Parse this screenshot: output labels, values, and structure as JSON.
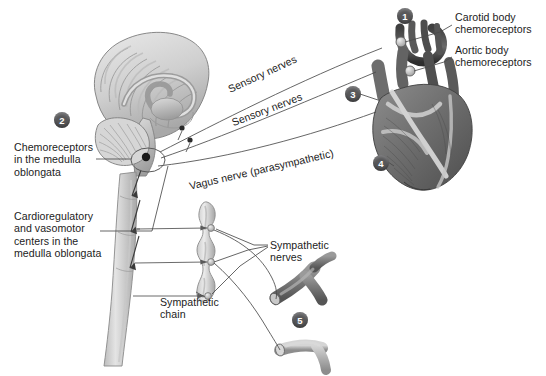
{
  "figure": {
    "background_color": "#ffffff",
    "text_color": "#1c1c1c",
    "marker_fill": "#58585a",
    "marker_text_color": "#ffffff",
    "line_color": "#4a4a4a"
  },
  "labels": {
    "carotid_body": "Carotid body\nchemoreceptors",
    "aortic_body": "Aortic body\nchemoreceptors",
    "medulla_chemoreceptors": "Chemoreceptors\nin the medulla\noblongata",
    "cardioregulatory_centers": "Cardioregulatory\nand vasomotor\ncenters in the\nmedulla oblongata",
    "sensory_nerves_upper": "Sensory nerves",
    "sensory_nerves_lower": "Sensory nerves",
    "vagus_nerve": "Vagus nerve (parasympathetic)",
    "sympathetic_nerves": "Sympathetic\nnerves",
    "sympathetic_chain": "Sympathetic\nchain"
  },
  "markers": [
    {
      "id": "1",
      "label": "1",
      "x": 397,
      "y": 8
    },
    {
      "id": "2",
      "label": "2",
      "x": 54,
      "y": 112
    },
    {
      "id": "3",
      "label": "3",
      "x": 345,
      "y": 86
    },
    {
      "id": "4",
      "label": "4",
      "x": 373,
      "y": 155
    },
    {
      "id": "5",
      "label": "5",
      "x": 292,
      "y": 312
    }
  ],
  "anatomy": {
    "brain": "mid-sagittal brain with cerebral cortex, corpus callosum and cerebellum",
    "brainstem": "brainstem and medulla oblongata",
    "spinal_cord": "spinal cord",
    "heart": "heart with aortic arch and great vessels",
    "sympathetic_chain": "sympathetic chain with three ganglia",
    "blood_vessel_upper": "branching arteriole",
    "blood_vessel_lower": "branching arteriole"
  }
}
